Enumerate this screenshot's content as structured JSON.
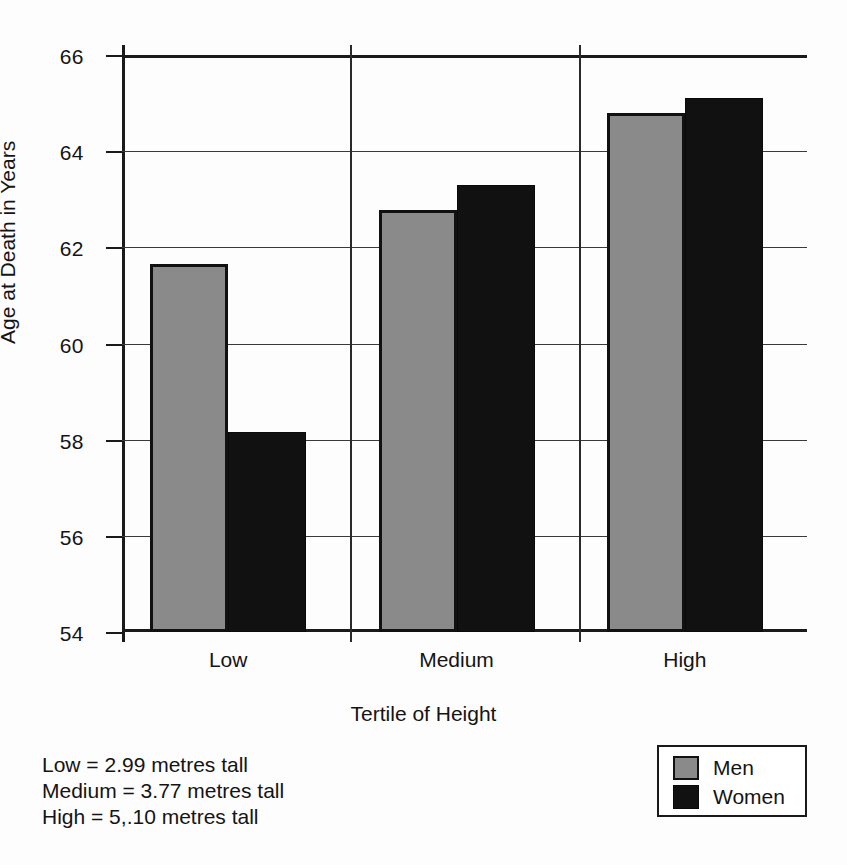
{
  "chart_data": {
    "type": "bar",
    "title": "",
    "xlabel": "Tertile of Height",
    "ylabel": "Age at Death in Years",
    "categories": [
      "Low",
      "Medium",
      "High"
    ],
    "series": [
      {
        "name": "Men",
        "color": "#8a8a8a",
        "values": [
          61.65,
          62.78,
          64.8
        ]
      },
      {
        "name": "Women",
        "color": "#111111",
        "values": [
          58.17,
          63.3,
          65.1
        ]
      }
    ],
    "ylim": [
      54,
      66
    ],
    "yticks": [
      54,
      56,
      58,
      60,
      62,
      64,
      66
    ],
    "ytick_labels": [
      "54",
      "56",
      "58",
      "60",
      "62",
      "64",
      "66"
    ],
    "grid": true,
    "legend_position": "bottom-right"
  },
  "axis": {
    "y_title": "Age at Death in Years",
    "x_title": "Tertile of Height"
  },
  "legend": {
    "items": [
      {
        "label": "Men",
        "swatch": "men-swatch"
      },
      {
        "label": "Women",
        "swatch": "women-swatch"
      }
    ]
  },
  "notes": {
    "lines": [
      "Low = 2.99 metres tall",
      "Medium = 3.77 metres tall",
      "High = 5,.10 metres tall"
    ]
  }
}
